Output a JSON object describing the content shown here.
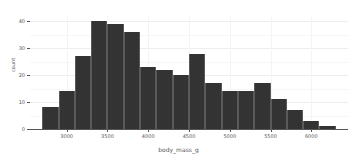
{
  "chart_data": {
    "type": "bar",
    "title": "",
    "subtitle": "",
    "xlabel": "body_mass_g",
    "ylabel": "count",
    "bin_width": 200,
    "bin_starts": [
      2700,
      2900,
      3100,
      3300,
      3500,
      3700,
      3900,
      4100,
      4300,
      4500,
      4700,
      4900,
      5100,
      5300,
      5500,
      5700,
      5900,
      6100
    ],
    "categories": [
      "2700-2900",
      "2900-3100",
      "3100-3300",
      "3300-3500",
      "3500-3700",
      "3700-3900",
      "3900-4100",
      "4100-4300",
      "4300-4500",
      "4500-4700",
      "4700-4900",
      "4900-5100",
      "5100-5300",
      "5300-5500",
      "5500-5700",
      "5700-5900",
      "5900-6100",
      "6100-6300"
    ],
    "values": [
      8,
      14,
      27,
      40,
      39,
      36,
      23,
      22,
      20,
      28,
      17,
      14,
      14,
      17,
      11,
      7,
      3,
      1
    ],
    "xlim": [
      2550,
      6450
    ],
    "ylim": [
      0,
      42
    ],
    "xticks": [
      3000,
      3500,
      4000,
      4500,
      5000,
      5500,
      6000
    ],
    "xtick_labels": [
      "3000",
      "3500",
      "4000",
      "4500",
      "5000",
      "5500",
      "6000"
    ],
    "yticks": [
      0,
      10,
      20,
      30,
      40
    ],
    "ytick_labels": [
      "0",
      "10",
      "20",
      "30",
      "40"
    ],
    "grid": true,
    "legend": null,
    "bar_color": "#333333",
    "bar_edge_color": "#5a5a5a",
    "grid_color": "#eeeeee",
    "axis_color": "#555555",
    "background_color": "#ffffff"
  }
}
